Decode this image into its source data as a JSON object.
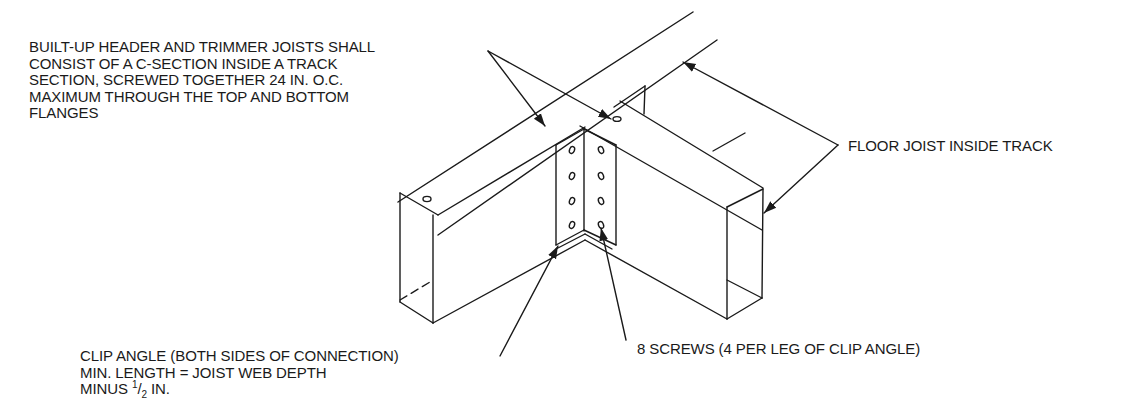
{
  "figure": {
    "type": "isometric construction detail"
  },
  "labels": {
    "header_note": {
      "lines": [
        "BUILT-UP HEADER AND TRIMMER JOISTS SHALL",
        "CONSIST OF A C-SECTION INSIDE A TRACK",
        "SECTION, SCREWED TOGETHER 24 IN. O.C.",
        "MAXIMUM THROUGH THE TOP AND BOTTOM",
        "FLANGES"
      ]
    },
    "floor_joist_note": {
      "text": "FLOOR JOIST INSIDE TRACK"
    },
    "clip_angle_note": {
      "lines": [
        "CLIP ANGLE (BOTH SIDES OF CONNECTION)",
        "MIN. LENGTH = JOIST WEB DEPTH"
      ],
      "line3_prefix": "MINUS ",
      "fraction_num": "1",
      "fraction_sep": "/",
      "fraction_den": "2",
      "line3_suffix": " IN."
    },
    "screws_note": {
      "text": "8 SCREWS (4 PER LEG OF CLIP ANGLE)"
    }
  },
  "colors": {
    "line": "#1a1a1a",
    "background": "#ffffff"
  }
}
